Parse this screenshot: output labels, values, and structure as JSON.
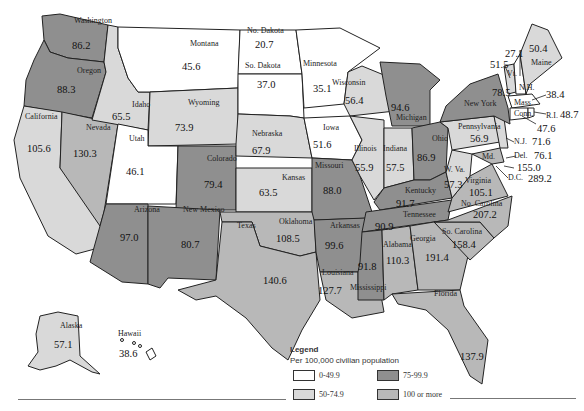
{
  "colors": {
    "bin_0_49": "#ffffff",
    "bin_50_74": "#d9d9d9",
    "bin_75_99": "#8f8f8f",
    "bin_100_plus": "#b8b8b8",
    "stroke": "#222222"
  },
  "legend": {
    "title": "Legend",
    "subtitle": "Per 100,000 civilian population",
    "items": [
      {
        "label": "0-49.9",
        "bin": "bin_0_49"
      },
      {
        "label": "50-74.9",
        "bin": "bin_50_74"
      },
      {
        "label": "75-99.9",
        "bin": "bin_75_99"
      },
      {
        "label": "100 or more",
        "bin": "bin_100_plus"
      }
    ]
  },
  "states": {
    "washington": {
      "name": "Washington",
      "value": "86.2"
    },
    "oregon": {
      "name": "Oregon",
      "value": "88.3"
    },
    "california": {
      "name": "California",
      "value": "105.6"
    },
    "nevada": {
      "name": "Nevada",
      "value": "130.3"
    },
    "idaho": {
      "name": "Idaho",
      "value": "65.5"
    },
    "montana": {
      "name": "Montana",
      "value": "45.6"
    },
    "wyoming": {
      "name": "Wyoming",
      "value": "73.9"
    },
    "utah": {
      "name": "Utah",
      "value": "46.1"
    },
    "colorado": {
      "name": "Colorado",
      "value": "79.4"
    },
    "arizona": {
      "name": "Arizona",
      "value": "97.0"
    },
    "new_mexico": {
      "name": "New Mexico",
      "value": "80.7"
    },
    "north_dakota": {
      "name": "No. Dakota",
      "value": "20.7"
    },
    "south_dakota": {
      "name": "So. Dakota",
      "value": "37.0"
    },
    "nebraska": {
      "name": "Nebraska",
      "value": "67.9"
    },
    "kansas": {
      "name": "Kansas",
      "value": "63.5"
    },
    "oklahoma": {
      "name": "Oklahoma",
      "value": "108.5"
    },
    "texas": {
      "name": "Texas",
      "value": "140.6"
    },
    "minnesota": {
      "name": "Minnesota",
      "value": "35.1"
    },
    "iowa": {
      "name": "Iowa",
      "value": "51.6"
    },
    "missouri": {
      "name": "Missouri",
      "value": "88.0"
    },
    "arkansas": {
      "name": "Arkansas",
      "value": "99.6"
    },
    "louisiana": {
      "name": "Louisiana",
      "value": "127.7"
    },
    "wisconsin": {
      "name": "Wisconsin",
      "value": "56.4"
    },
    "illinois": {
      "name": "Illinois",
      "value": "55.9"
    },
    "michigan": {
      "name": "Michigan",
      "value": "94.6"
    },
    "indiana": {
      "name": "Indiana",
      "value": "57.5"
    },
    "ohio": {
      "name": "Ohio",
      "value": "86.9"
    },
    "kentucky": {
      "name": "Kentucky",
      "value": "91.7"
    },
    "tennessee": {
      "name": "Tennessee",
      "value": "90.9"
    },
    "mississippi": {
      "name": "Mississippi",
      "value": "91.8"
    },
    "alabama": {
      "name": "Alabama",
      "value": "110.3"
    },
    "georgia": {
      "name": "Georgia",
      "value": "191.4"
    },
    "florida": {
      "name": "Florida",
      "value": "137.9"
    },
    "south_carolina": {
      "name": "So. Carolina",
      "value": "158.4"
    },
    "north_carolina": {
      "name": "No. Carolina",
      "value": "207.2"
    },
    "virginia": {
      "name": "Virginia",
      "value": "105.1"
    },
    "west_virginia": {
      "name": "W. Va.",
      "value": "57.3"
    },
    "maryland": {
      "name": "Md.",
      "value": "155.0"
    },
    "delaware": {
      "name": "Del.",
      "value": "76.1"
    },
    "dc": {
      "name": "D.C.",
      "value": "289.2"
    },
    "new_jersey": {
      "name": "N.J.",
      "value": "71.6"
    },
    "pennsylvania": {
      "name": "Pennsylvania",
      "value": "56.9"
    },
    "new_york": {
      "name": "New York",
      "value": "78.5"
    },
    "connecticut": {
      "name": "Conn.",
      "value": "47.6"
    },
    "rhode_island": {
      "name": "R.I.",
      "value": "48.7"
    },
    "massachusetts": {
      "name": "Mass.",
      "value": "38.4"
    },
    "vermont": {
      "name": "Vt.",
      "value": "51.5"
    },
    "new_hampshire": {
      "name": "N.H.",
      "value": "27.1"
    },
    "maine": {
      "name": "Maine",
      "value": "50.4"
    },
    "alaska": {
      "name": "Alaska",
      "value": "57.1"
    },
    "hawaii": {
      "name": "Hawaii",
      "value": "38.6"
    }
  }
}
